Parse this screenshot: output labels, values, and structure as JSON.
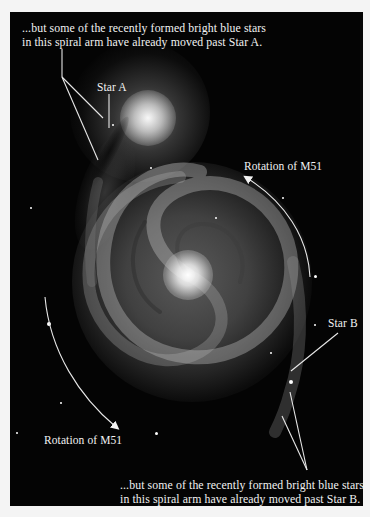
{
  "figure": {
    "background_color": "#040404",
    "annotation_color": "#f2f2f2",
    "captions": {
      "top": {
        "line1": "...but some of the recently formed bright blue stars",
        "line2": "in this spiral arm have already moved past Star A."
      },
      "bottom": {
        "line1": "...but some of the recently formed bright blue stars",
        "line2": "in this spiral arm have already moved past Star B."
      }
    },
    "labels": {
      "star_a": "Star A",
      "star_b": "Star B",
      "rotation_upper": "Rotation of M51",
      "rotation_lower": "Rotation of M51"
    }
  }
}
